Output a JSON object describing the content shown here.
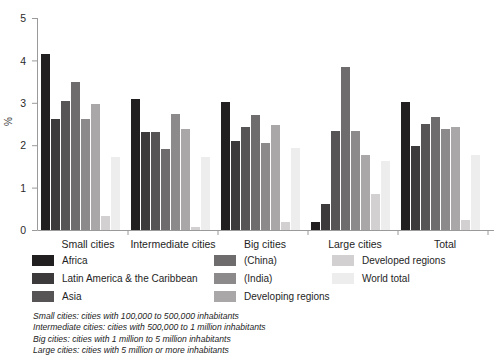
{
  "chart_data": {
    "type": "bar",
    "title": "",
    "subtitle": "",
    "xlabel": "",
    "ylabel": "%",
    "ylim": [
      0,
      5
    ],
    "yticks": [
      "0",
      "1",
      "2",
      "3",
      "4",
      "5"
    ],
    "grid": false,
    "legend_position": "bottom",
    "categories": [
      "Small cities",
      "Intermediate cities",
      "Big cities",
      "Large cities",
      "Total"
    ],
    "series": [
      {
        "name": "Africa",
        "color": "#211f20",
        "values": [
          4.15,
          3.09,
          3.03,
          0.19,
          3.02
        ]
      },
      {
        "name": "Latin America & the Caribbean",
        "color": "#3c3a3b",
        "values": [
          2.62,
          2.32,
          2.1,
          0.62,
          1.97
        ]
      },
      {
        "name": "Asia",
        "color": "#565455",
        "values": [
          3.05,
          2.32,
          2.42,
          2.33,
          2.51
        ]
      },
      {
        "name": "(China)",
        "color": "#6e6c6d",
        "values": [
          3.48,
          1.92,
          2.72,
          3.84,
          2.67
        ]
      },
      {
        "name": "(India)",
        "color": "#8c8a8b",
        "values": [
          2.63,
          2.74,
          2.06,
          2.33,
          2.38
        ]
      },
      {
        "name": "Developing regions",
        "color": "#a9a7a8",
        "values": [
          2.98,
          2.38,
          2.48,
          1.77,
          2.43
        ]
      },
      {
        "name": "Developed regions",
        "color": "#d2d0d1",
        "values": [
          0.33,
          0.06,
          0.18,
          0.86,
          0.23
        ]
      },
      {
        "name": "World total",
        "color": "#ededed",
        "values": [
          1.72,
          1.72,
          1.93,
          1.62,
          1.78
        ]
      }
    ]
  },
  "legend": {
    "columns": [
      {
        "items": [
          {
            "label": "Africa",
            "color": "#211f20"
          },
          {
            "label": "Latin America & the Caribbean",
            "color": "#3c3a3b"
          },
          {
            "label": "Asia",
            "color": "#565455"
          }
        ]
      },
      {
        "items": [
          {
            "label": "(China)",
            "color": "#6e6c6d"
          },
          {
            "label": "(India)",
            "color": "#8c8a8b"
          },
          {
            "label": "Developing regions",
            "color": "#a9a7a8"
          }
        ]
      },
      {
        "items": [
          {
            "label": "Developed regions",
            "color": "#d2d0d1"
          },
          {
            "label": "World total",
            "color": "#ededed"
          }
        ]
      }
    ]
  },
  "footnotes": [
    "Small cities: cities with 100,000 to 500,000 inhabitants",
    "Intermediate cities: cities with 500,000 to 1 million inhabitants",
    "Big cities: cities with 1 million to 5 million inhabitants",
    "Large cities: cities with 5 million or more inhabitants"
  ],
  "axis": {
    "line_color": "#9a9a9a"
  }
}
